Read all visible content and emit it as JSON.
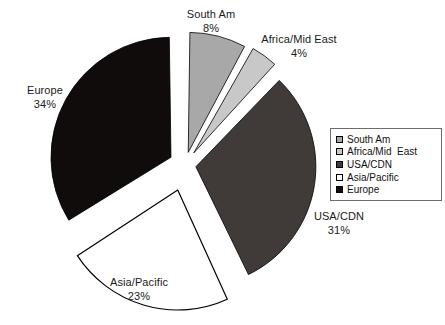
{
  "chart_data": {
    "type": "pie",
    "title": "",
    "categories": [
      "South Am",
      "Africa/Mid East",
      "USA/CDN",
      "Asia/Pacific",
      "Europe"
    ],
    "values": [
      8,
      4,
      31,
      23,
      34
    ],
    "value_labels": [
      "8%",
      "4%",
      "31%",
      "23%",
      "34%"
    ],
    "unit": "%",
    "legend_position": "right",
    "grid": false,
    "exploded": true,
    "slices": [
      {
        "label": "South Am",
        "value": 8,
        "value_label": "8%",
        "color": "#a8a8a8",
        "stroke": "#000000",
        "legend_label": "South Am"
      },
      {
        "label": "Africa/Mid East",
        "value": 4,
        "value_label": "4%",
        "color": "#c8c8c8",
        "stroke": "#000000",
        "legend_label": "Africa/Mid  East"
      },
      {
        "label": "USA/CDN",
        "value": 31,
        "value_label": "31%",
        "color": "#403a38",
        "stroke": "#000000",
        "legend_label": "USA/CDN"
      },
      {
        "label": "Asia/Pacific",
        "value": 23,
        "value_label": "23%",
        "color": "#ffffff",
        "stroke": "#000000",
        "legend_label": "Asia/Pacific"
      },
      {
        "label": "Europe",
        "value": 34,
        "value_label": "34%",
        "color": "#100c0c",
        "stroke": "#000000",
        "legend_label": "Europe"
      }
    ]
  },
  "labels": {
    "south_am": {
      "name": "South Am",
      "pct": "8%"
    },
    "africa": {
      "name": "Africa/Mid East",
      "pct": "4%"
    },
    "usa": {
      "name": "USA/CDN",
      "pct": "31%"
    },
    "asia": {
      "name": "Asia/Pacific",
      "pct": "23%"
    },
    "europe": {
      "name": "Europe",
      "pct": "34%"
    }
  },
  "legend": {
    "items": [
      {
        "label": "South Am"
      },
      {
        "label": "Africa/Mid  East"
      },
      {
        "label": "USA/CDN"
      },
      {
        "label": "Asia/Pacific"
      },
      {
        "label": "Europe"
      }
    ]
  }
}
